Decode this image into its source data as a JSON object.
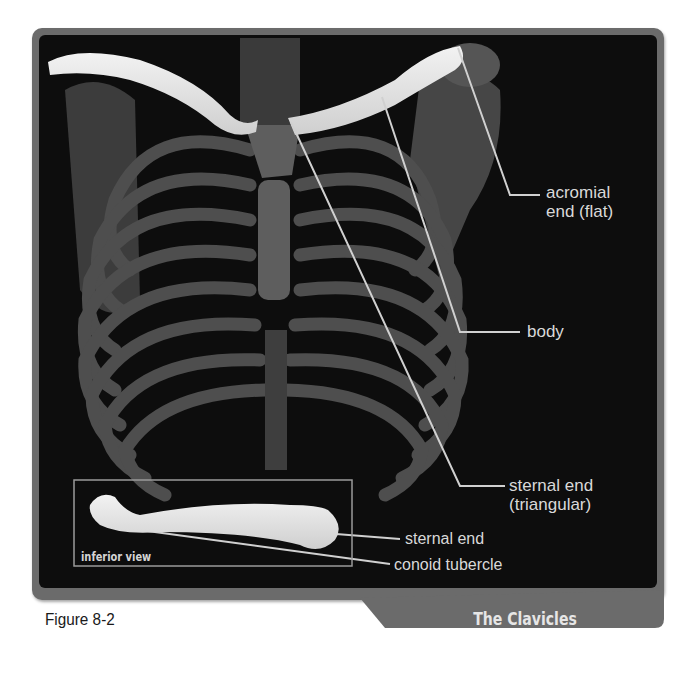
{
  "figure": {
    "caption": "Figure 8-2",
    "title": "The Clavicles"
  },
  "labels": {
    "acromial_end": [
      "acromial",
      "end (flat)"
    ],
    "body": "body",
    "sternal_end": [
      "sternal end",
      "(triangular)"
    ],
    "inset_sternal_end": "sternal end",
    "inset_conoid_tubercle": "conoid tubercle"
  },
  "inset": {
    "label": "inferior view"
  },
  "colors": {
    "frame": "#6b6b6b",
    "panel": "#0d0d0d",
    "bone_highlight": "#e8e8e8",
    "bone_dim": "#5a5a5a",
    "text": "#d9d9d9",
    "leader_line": "#d0d0d0"
  }
}
